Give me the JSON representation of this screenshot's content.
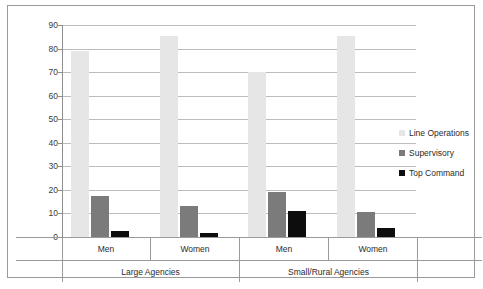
{
  "chart_data": {
    "type": "bar",
    "title": "",
    "xlabel": "",
    "ylabel": "",
    "ylim": [
      0,
      90
    ],
    "ytick_step": 10,
    "yticks": [
      "90",
      "80",
      "70",
      "60",
      "50",
      "40",
      "30",
      "20",
      "10",
      "0"
    ],
    "grid": true,
    "legend_position": "right",
    "group_labels": [
      "Large Agencies",
      "Small/Rural Agencies"
    ],
    "categories": [
      "Men",
      "Women",
      "Men",
      "Women"
    ],
    "series": [
      {
        "name": "Line Operations",
        "color": "#e6e6e6",
        "values": [
          79,
          85.5,
          70,
          85.5
        ]
      },
      {
        "name": "Supervisory",
        "color": "#7b7b7b",
        "values": [
          17.5,
          13,
          19,
          10.5
        ]
      },
      {
        "name": "Top Command",
        "color": "#0d0d0d",
        "values": [
          2.5,
          1.5,
          11,
          4
        ]
      }
    ]
  },
  "legend": {
    "items": [
      {
        "label": "Line Operations"
      },
      {
        "label": "Supervisory"
      },
      {
        "label": "Top Command"
      }
    ]
  },
  "axis": {
    "category_row": [
      "Men",
      "Women",
      "Men",
      "Women"
    ],
    "group_row": [
      "Large Agencies",
      "Small/Rural Agencies"
    ]
  },
  "caption": {
    "text": ""
  }
}
